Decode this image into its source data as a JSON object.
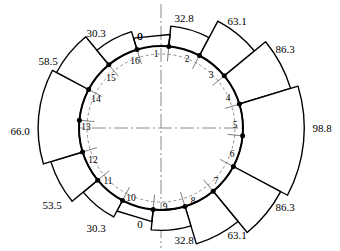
{
  "figure": {
    "title": "",
    "center_x": 161,
    "center_y": 128,
    "outer_circle_radius": 82,
    "inner_dashed_radius": 74,
    "node_count": 16,
    "colors": {
      "line": "#000000",
      "background": "#ffffff",
      "axis": "#808080",
      "dashed_arc": "#909090"
    }
  },
  "chart_data": {
    "type": "bar",
    "title": "",
    "xlabel": "",
    "ylabel": "",
    "coordinate_system": "polar",
    "categories": [
      "1",
      "2",
      "3",
      "4",
      "5",
      "6",
      "7",
      "8",
      "9",
      "10",
      "11",
      "12",
      "13",
      "14",
      "15",
      "16"
    ],
    "values": [
      0,
      32.8,
      63.1,
      86.3,
      98.8,
      86.3,
      63.1,
      32.8,
      0,
      30.3,
      53.5,
      66.0,
      53.5,
      30.3,
      0,
      0
    ],
    "segments": [
      {
        "id": 1,
        "label": "0",
        "value": 0.0,
        "from_node": 1,
        "to_node": 2,
        "label_x": 140,
        "label_y": 36
      },
      {
        "id": 2,
        "label": "32.8",
        "value": 32.8,
        "from_node": 1,
        "to_node": 2,
        "label_x": 184,
        "label_y": 18
      },
      {
        "id": 3,
        "label": "63.1",
        "value": 63.1,
        "from_node": 2,
        "to_node": 3,
        "label_x": 237,
        "label_y": 21
      },
      {
        "id": 4,
        "label": "86.3",
        "value": 86.3,
        "from_node": 3,
        "to_node": 4,
        "label_x": 285,
        "label_y": 49
      },
      {
        "id": 5,
        "label": "98.8",
        "value": 98.8,
        "from_node": 4,
        "to_node": 6,
        "label_x": 322,
        "label_y": 128
      },
      {
        "id": 6,
        "label": "86.3",
        "value": 86.3,
        "from_node": 6,
        "to_node": 7,
        "label_x": 285,
        "label_y": 207
      },
      {
        "id": 7,
        "label": "63.1",
        "value": 63.1,
        "from_node": 7,
        "to_node": 8,
        "label_x": 237,
        "label_y": 235
      },
      {
        "id": 8,
        "label": "32.8",
        "value": 32.8,
        "from_node": 8,
        "to_node": 9,
        "label_x": 184,
        "label_y": 240
      },
      {
        "id": 9,
        "label": "0",
        "value": 0.0,
        "from_node": 9,
        "to_node": 10,
        "label_x": 140,
        "label_y": 224
      },
      {
        "id": 10,
        "label": "30.3",
        "value": 30.3,
        "from_node": 10,
        "to_node": 11,
        "label_x": 96,
        "label_y": 228
      },
      {
        "id": 11,
        "label": "53.5",
        "value": 53.5,
        "from_node": 11,
        "to_node": 12,
        "label_x": 52,
        "label_y": 205
      },
      {
        "id": 12,
        "label": "66.0",
        "value": 66.0,
        "from_node": 12,
        "to_node": 14,
        "label_x": 20,
        "label_y": 131
      },
      {
        "id": 13,
        "label": "58.5",
        "value": 58.5,
        "from_node": 14,
        "to_node": 15,
        "label_x": 48,
        "label_y": 61
      },
      {
        "id": 14,
        "label": "30.3",
        "value": 30.3,
        "from_node": 15,
        "to_node": 16,
        "label_x": 96,
        "label_y": 33
      },
      {
        "id": 15,
        "label": "0",
        "value": 0.0,
        "from_node": 16,
        "to_node": 1,
        "label_x": 140,
        "label_y": 36
      }
    ],
    "node_labels": [
      {
        "n": "1",
        "x": 156,
        "y": 55
      },
      {
        "n": "2",
        "x": 187,
        "y": 60
      },
      {
        "n": "3",
        "x": 211,
        "y": 76
      },
      {
        "n": "4",
        "x": 228,
        "y": 99
      },
      {
        "n": "5",
        "x": 235,
        "y": 126
      },
      {
        "n": "6",
        "x": 232,
        "y": 155
      },
      {
        "n": "7",
        "x": 216,
        "y": 182
      },
      {
        "n": "8",
        "x": 193,
        "y": 202
      },
      {
        "n": "9",
        "x": 165,
        "y": 208
      },
      {
        "n": "10",
        "x": 131,
        "y": 199
      },
      {
        "n": "11",
        "x": 108,
        "y": 182
      },
      {
        "n": "12",
        "x": 93,
        "y": 161
      },
      {
        "n": "13",
        "x": 86,
        "y": 128
      },
      {
        "n": "14",
        "x": 96,
        "y": 100
      },
      {
        "n": "15",
        "x": 111,
        "y": 79
      },
      {
        "n": "16",
        "x": 135,
        "y": 62
      }
    ],
    "legend": {
      "show": false
    },
    "grid": false
  }
}
